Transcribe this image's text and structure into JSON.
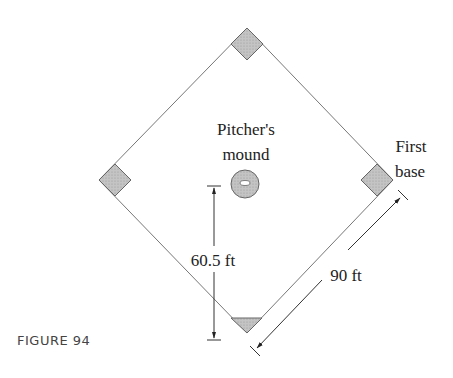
{
  "figure": {
    "caption": "FIGURE 94",
    "labels": {
      "mound_line1": "Pitcher's",
      "mound_line2": "mound",
      "first_line1": "First",
      "first_line2": "base",
      "pitch_distance": "60.5 ft",
      "base_distance": "90 ft"
    },
    "colors": {
      "line": "#777777",
      "base_fill": "#bdbdbd",
      "base_stroke": "#666666",
      "text": "#222222",
      "caption": "#444444"
    }
  }
}
